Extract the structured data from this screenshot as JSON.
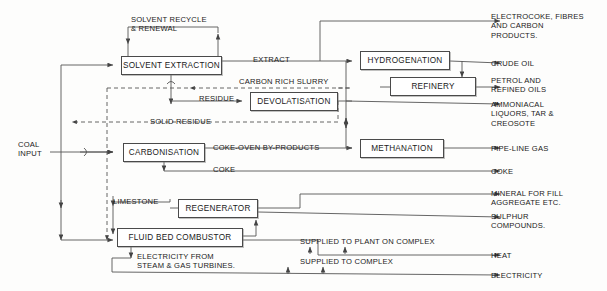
{
  "diagram": {
    "colors": {
      "line": "#555555",
      "dashed": "#8a8a8a",
      "box_border": "#4a4a4a",
      "text": "#1a1a1a",
      "background": "#fdfdfc"
    },
    "nodes": [
      {
        "id": "solvent-extraction",
        "label": "SOLVENT EXTRACTION",
        "x": 121,
        "y": 56,
        "w": 101,
        "h": 19
      },
      {
        "id": "devolatisation",
        "label": "DEVOLATISATION",
        "x": 250,
        "y": 92,
        "w": 88,
        "h": 19
      },
      {
        "id": "hydrogenation",
        "label": "HYDROGENATION",
        "x": 360,
        "y": 51,
        "w": 90,
        "h": 19
      },
      {
        "id": "refinery",
        "label": "REFINERY",
        "x": 390,
        "y": 77,
        "w": 86,
        "h": 19
      },
      {
        "id": "carbonisation",
        "label": "CARBONISATION",
        "x": 123,
        "y": 143,
        "w": 82,
        "h": 19
      },
      {
        "id": "methanation",
        "label": "METHANATION",
        "x": 360,
        "y": 139,
        "w": 84,
        "h": 19
      },
      {
        "id": "regenerator",
        "label": "REGENERATOR",
        "x": 178,
        "y": 199,
        "w": 80,
        "h": 19
      },
      {
        "id": "fluid-bed-combustor",
        "label": "FLUID BED COMBUSTOR",
        "x": 117,
        "y": 228,
        "w": 126,
        "h": 19
      }
    ],
    "flow_labels": [
      {
        "id": "solvent-recycle",
        "text": "SOLVENT RECYCLE\n& RENEWAL",
        "x": 131,
        "y": 15
      },
      {
        "id": "extract",
        "text": "EXTRACT",
        "x": 253,
        "y": 55
      },
      {
        "id": "carbon-rich-slurry",
        "text": "CARBON RICH SLURRY",
        "x": 239,
        "y": 77
      },
      {
        "id": "residue",
        "text": "RESIDUE",
        "x": 199,
        "y": 94
      },
      {
        "id": "solid-residue",
        "text": "SOLID RESIDUE",
        "x": 150,
        "y": 117
      },
      {
        "id": "coke-oven-by-products",
        "text": "COKE-OVEN BY-PRODUCTS",
        "x": 213,
        "y": 143
      },
      {
        "id": "coke-stream",
        "text": "COKE",
        "x": 213,
        "y": 165
      },
      {
        "id": "limestone",
        "text": "LIMESTONE",
        "x": 113,
        "y": 197
      },
      {
        "id": "electricity-from-turbines",
        "text": "ELECTRICITY FROM\nSTEAM & GAS TURBINES.",
        "x": 137,
        "y": 252
      },
      {
        "id": "supplied-to-plant",
        "text": "SUPPLIED TO PLANT ON COMPLEX",
        "x": 300,
        "y": 237
      },
      {
        "id": "supplied-to-complex",
        "text": "SUPPLIED TO COMPLEX",
        "x": 300,
        "y": 257
      }
    ],
    "input_label": {
      "id": "coal-input",
      "text": "COAL\nINPUT",
      "x": 18,
      "y": 140
    },
    "outputs": [
      {
        "id": "electrocoke",
        "text": "ELECTROCOKE, FIBRES\nAND CARBON\nPRODUCTS.",
        "x": 491,
        "y": 12,
        "arrow_y": 21
      },
      {
        "id": "crude-oil",
        "text": "CRUDE OIL",
        "x": 491,
        "y": 60,
        "arrow_y": 63
      },
      {
        "id": "petrol-refined-oils",
        "text": "PETROL AND\nREFINED OILS",
        "x": 491,
        "y": 76,
        "arrow_y": 84
      },
      {
        "id": "ammoniacal",
        "text": "AMMONIACAL\nLIQUORS, TAR &\nCREOSOTE",
        "x": 491,
        "y": 100,
        "arrow_y": 104
      },
      {
        "id": "pipe-line-gas",
        "text": "PIPE-LINE GAS",
        "x": 491,
        "y": 145,
        "arrow_y": 148
      },
      {
        "id": "coke-output",
        "text": "COKE",
        "x": 491,
        "y": 168,
        "arrow_y": 171
      },
      {
        "id": "mineral-for-fill",
        "text": "MINERAL FOR FILL\nAGGREGATE ETC.",
        "x": 491,
        "y": 190,
        "arrow_y": 194
      },
      {
        "id": "sulphur-compounds",
        "text": "SULPHUR\nCOMPOUNDS.",
        "x": 491,
        "y": 213,
        "arrow_y": 217
      },
      {
        "id": "heat",
        "text": "HEAT",
        "x": 491,
        "y": 252,
        "arrow_y": 255
      },
      {
        "id": "electricity",
        "text": "ELECTRICITY",
        "x": 491,
        "y": 272,
        "arrow_y": 275
      }
    ]
  }
}
